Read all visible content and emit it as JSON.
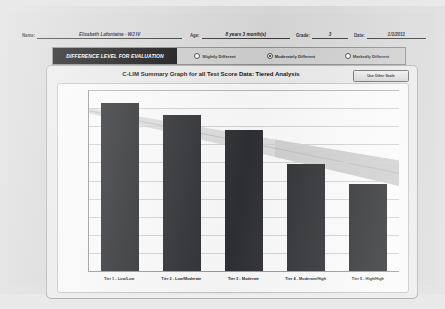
{
  "form": {
    "fields": [
      {
        "label": "Name:",
        "value": "Elizabeth Lafontaine - WJ IV"
      },
      {
        "label": "Age:",
        "value": "8 years 3 month(s)"
      },
      {
        "label": "Grade:",
        "value": "3"
      },
      {
        "label": "Date:",
        "value": "1/1/2011"
      }
    ]
  },
  "difference_level": {
    "title": "DIFFERENCE LEVEL FOR EVALUATION",
    "options": [
      {
        "label": "Slightly Different",
        "selected": false
      },
      {
        "label": "Moderately Different",
        "selected": true
      },
      {
        "label": "Markedly Different",
        "selected": false
      }
    ]
  },
  "chart_panel": {
    "scale_button_label": "Use Other Scale"
  },
  "chart_data": {
    "type": "bar",
    "title": "C-LIM Summary Graph for all Test Score Data: Tiered Analysis",
    "xlabel": "",
    "ylabel": "",
    "categories": [
      "Tier 1 - Low/Low",
      "Tier 2 - Low/Moderate",
      "Tier 3 - Moderate",
      "Tier 4 - Moderate/High",
      "Tier 5 - High/High"
    ],
    "values": [
      96.5,
      93.0,
      89.0,
      79.5,
      74.0
    ],
    "ylim": [
      50,
      100
    ],
    "yticks": [
      100,
      95,
      90,
      85,
      80,
      75,
      70,
      65,
      60,
      55,
      50
    ],
    "grid": true,
    "legend": "none",
    "bar_color": "#2f3033",
    "series": [
      {
        "name": "Test Score Data",
        "values": [
          96.5,
          93.0,
          89.0,
          79.5,
          74.0
        ]
      }
    ],
    "annotations": {
      "expectancy_band": {
        "description": "Diagonal shaded expectancy band declining from left to right",
        "upper_start": 95.0,
        "upper_end": 80.5,
        "lower_start": 93.5,
        "lower_end": 73.5,
        "band_color": "#d9d9d9",
        "center_line_color": "#b3b3b3"
      },
      "shaded_columns": {
        "description": "Darker grey overlay blocks over Tier 4 and Tier 5 band region",
        "color": "#c4c4c4"
      }
    }
  }
}
